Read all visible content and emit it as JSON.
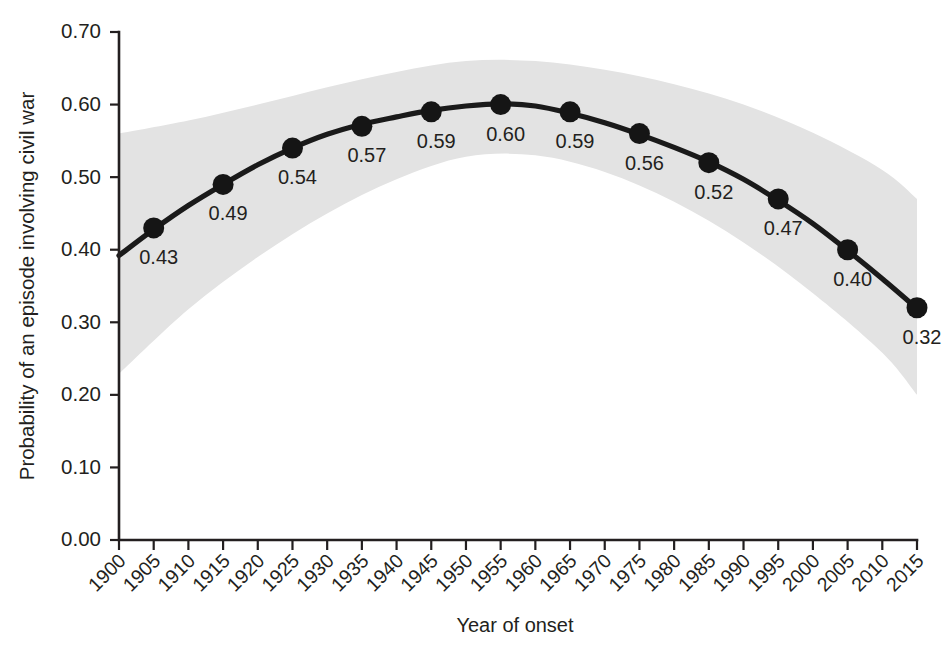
{
  "chart_data": {
    "type": "line",
    "title": "",
    "xlabel": "Year of onset",
    "ylabel": "Probability of an episode involving civil war",
    "xlim": [
      1900,
      2015
    ],
    "ylim": [
      0.0,
      0.7
    ],
    "grid": false,
    "legend": "none",
    "x_tick_labels": [
      "1900",
      "1905",
      "1910",
      "1915",
      "1920",
      "1925",
      "1930",
      "1935",
      "1940",
      "1945",
      "1950",
      "1955",
      "1960",
      "1965",
      "1970",
      "1975",
      "1980",
      "1985",
      "1990",
      "1995",
      "2000",
      "2005",
      "2010",
      "2015"
    ],
    "y_tick_labels": [
      "0.00",
      "0.10",
      "0.20",
      "0.30",
      "0.40",
      "0.50",
      "0.60",
      "0.70"
    ],
    "y_tick_values": [
      0.0,
      0.1,
      0.2,
      0.3,
      0.4,
      0.5,
      0.6,
      0.7
    ],
    "series": [
      {
        "name": "Probability of an episode involving civil war",
        "marker_color": "#151515",
        "line_color": "#1a1a1a",
        "x": [
          1905,
          1915,
          1925,
          1935,
          1945,
          1955,
          1965,
          1975,
          1985,
          1995,
          2005,
          2015
        ],
        "values": [
          0.43,
          0.49,
          0.54,
          0.57,
          0.59,
          0.6,
          0.59,
          0.56,
          0.52,
          0.47,
          0.4,
          0.32
        ],
        "data_labels": [
          "0.43",
          "0.49",
          "0.54",
          "0.57",
          "0.59",
          "0.60",
          "0.59",
          "0.56",
          "0.52",
          "0.47",
          "0.40",
          "0.32"
        ]
      }
    ],
    "fit_line": {
      "x": [
        1900,
        1905,
        1910,
        1915,
        1920,
        1925,
        1930,
        1935,
        1940,
        1945,
        1950,
        1955,
        1960,
        1965,
        1970,
        1975,
        1980,
        1985,
        1990,
        1995,
        2000,
        2005,
        2010,
        2015
      ],
      "values": [
        0.392,
        0.428,
        0.461,
        0.49,
        0.517,
        0.54,
        0.559,
        0.573,
        0.583,
        0.592,
        0.598,
        0.601,
        0.598,
        0.588,
        0.575,
        0.559,
        0.541,
        0.521,
        0.497,
        0.468,
        0.436,
        0.399,
        0.36,
        0.319
      ],
      "color": "#1a1a1a"
    },
    "confidence_band": {
      "label": "confidence interval",
      "color": "#e3e3e3",
      "x": [
        1900,
        1910,
        1920,
        1930,
        1940,
        1950,
        1960,
        1970,
        1980,
        1990,
        2000,
        2010,
        2015
      ],
      "upper": [
        0.56,
        0.578,
        0.6,
        0.624,
        0.645,
        0.66,
        0.66,
        0.648,
        0.628,
        0.6,
        0.561,
        0.51,
        0.47
      ],
      "lower": [
        0.229,
        0.318,
        0.39,
        0.45,
        0.497,
        0.528,
        0.53,
        0.507,
        0.466,
        0.41,
        0.34,
        0.258,
        0.2
      ]
    }
  },
  "axes": {
    "x_title": "Year of onset",
    "y_title": "Probability of an episode involving civil war"
  }
}
